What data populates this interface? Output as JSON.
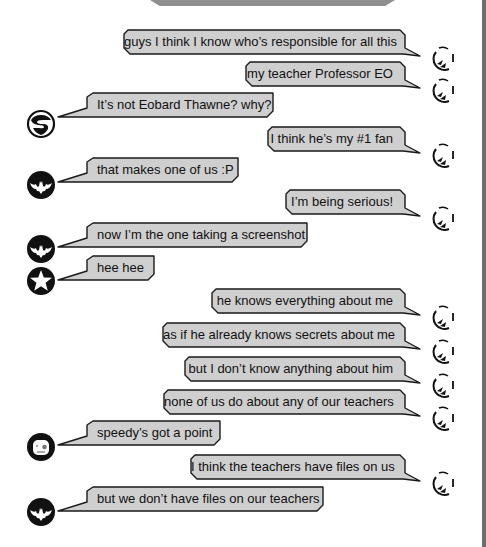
{
  "chat": {
    "colors": {
      "bubble_fill": "#cfcfcf",
      "bubble_stroke": "#1a1a1a",
      "avatar_dark": "#111111"
    },
    "messages": [
      {
        "side": "out",
        "avatar": "flash-icon",
        "text": "guys I think I know who’s responsible for all this",
        "x": 124,
        "y": 30,
        "w": 281
      },
      {
        "side": "out",
        "avatar": "flash-icon",
        "text": "my teacher Professor EO",
        "x": 246,
        "y": 62,
        "w": 159
      },
      {
        "side": "in",
        "avatar": "superman-icon",
        "text": "It’s not Eobard Thawne? why?",
        "x": 82,
        "y": 93,
        "w": 191,
        "ay": 109
      },
      {
        "side": "out",
        "avatar": "flash-icon",
        "text": "I think he’s my #1 fan",
        "x": 268,
        "y": 127,
        "w": 137
      },
      {
        "side": "in",
        "avatar": "batman-icon",
        "text": "that makes one of us :P",
        "x": 82,
        "y": 158,
        "w": 156,
        "ay": 170
      },
      {
        "side": "out",
        "avatar": "flash-icon",
        "text": "I’m being serious!",
        "x": 286,
        "y": 190,
        "w": 119
      },
      {
        "side": "in",
        "avatar": "batman-icon",
        "text": "now I’m the one taking a screenshot",
        "x": 82,
        "y": 223,
        "w": 225,
        "ay": 234
      },
      {
        "side": "in",
        "avatar": "star-icon",
        "text": "hee hee",
        "x": 82,
        "y": 256,
        "w": 72,
        "ay": 266
      },
      {
        "side": "out",
        "avatar": "flash-icon",
        "text": "he knows everything about me",
        "x": 212,
        "y": 289,
        "w": 193
      },
      {
        "side": "out",
        "avatar": "flash-icon",
        "text": "as if he already knows secrets about me",
        "x": 163,
        "y": 323,
        "w": 242
      },
      {
        "side": "out",
        "avatar": "flash-icon",
        "text": "but I don’t know anything about him",
        "x": 185,
        "y": 357,
        "w": 220
      },
      {
        "side": "out",
        "avatar": "flash-icon",
        "text": "none of us do about any of our teachers",
        "x": 164,
        "y": 390,
        "w": 241
      },
      {
        "side": "in",
        "avatar": "robin-icon",
        "text": "speedy’s got a point",
        "x": 82,
        "y": 421,
        "w": 138,
        "ay": 432
      },
      {
        "side": "out",
        "avatar": "flash-icon",
        "text": "I think the teachers have files on us",
        "x": 191,
        "y": 455,
        "w": 214
      },
      {
        "side": "in",
        "avatar": "batman-icon",
        "text": "but we don’t have files on our teachers",
        "x": 82,
        "y": 487,
        "w": 241,
        "ay": 497
      }
    ]
  }
}
